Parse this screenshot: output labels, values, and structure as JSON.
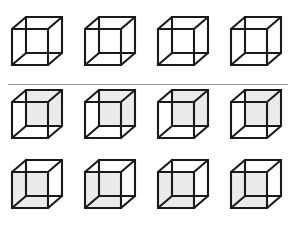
{
  "figure": {
    "background_color": "#ffffff",
    "width": 293,
    "height": 230
  },
  "style": {
    "edge_color": "#1a1a1a",
    "edge_width": 2.1,
    "shaded_face_color": "#ebebeb",
    "divider_color": "#9a9a9a",
    "unshaded_face_color": "none"
  },
  "divider": {
    "name": "horizontal-rule",
    "x": 8,
    "y": 84,
    "width": 280,
    "height": 1
  },
  "geometry": {
    "note": "Necker cube: front square plus back square offset up-and-right, joined by four oblique edges.",
    "viewbox": "0 0 54 60",
    "front_face": {
      "x": 2,
      "y": 14,
      "w": 36,
      "h": 36
    },
    "back_face": {
      "x": 16,
      "y": 2,
      "w": 36,
      "h": 36
    },
    "offset_x": 14,
    "offset_y": -12
  },
  "rows": [
    {
      "id": "row-0",
      "label": "Row 1 — plain wireframe cubes",
      "shading": "none",
      "count": 4,
      "cubes": [
        {
          "label": "cube-r1-c1",
          "shaded": "none"
        },
        {
          "label": "cube-r1-c2",
          "shaded": "none"
        },
        {
          "label": "cube-r1-c3",
          "shaded": "none"
        },
        {
          "label": "cube-r1-c4",
          "shaded": "none"
        }
      ]
    },
    {
      "id": "row-1",
      "label": "Row 2 — cubes with back (upper-right) face shaded",
      "shading": "back",
      "count": 4,
      "cubes": [
        {
          "label": "cube-r2-c1",
          "shaded": "back"
        },
        {
          "label": "cube-r2-c2",
          "shaded": "back"
        },
        {
          "label": "cube-r2-c3",
          "shaded": "back"
        },
        {
          "label": "cube-r2-c4",
          "shaded": "back"
        }
      ]
    },
    {
      "id": "row-2",
      "label": "Row 3 — cubes with front (lower-left) face shaded",
      "shading": "front",
      "count": 4,
      "cubes": [
        {
          "label": "cube-r3-c1",
          "shaded": "front"
        },
        {
          "label": "cube-r3-c2",
          "shaded": "front"
        },
        {
          "label": "cube-r3-c3",
          "shaded": "front"
        },
        {
          "label": "cube-r3-c4",
          "shaded": "front"
        }
      ]
    }
  ]
}
